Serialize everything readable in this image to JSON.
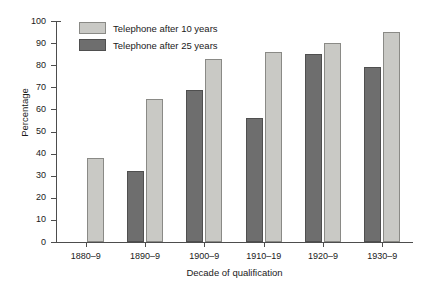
{
  "chart_data": {
    "type": "bar",
    "title": "",
    "xlabel": "Decade of qualification",
    "ylabel": "Percentage",
    "categories": [
      "1880–9",
      "1890–9",
      "1900–9",
      "1910–19",
      "1920–9",
      "1930–9"
    ],
    "series": [
      {
        "name": "Telephone after 25 years",
        "color": "#6e6e6e",
        "values": [
          null,
          32,
          69,
          56,
          85,
          79
        ]
      },
      {
        "name": "Telephone after 10 years",
        "color": "#c9c9c5",
        "values": [
          38,
          64.5,
          83,
          86,
          90,
          95
        ]
      }
    ],
    "ylim": [
      0,
      100
    ],
    "yticks": [
      0,
      10,
      20,
      30,
      40,
      50,
      60,
      70,
      80,
      90,
      100
    ],
    "ytick_labels": [
      "0",
      "10",
      "20",
      "30",
      "40",
      "50",
      "60",
      "70",
      "80",
      "90",
      "100"
    ],
    "grid": false,
    "legend_position": "top-left",
    "legend": [
      "Telephone after 10 years",
      "Telephone after 25 years"
    ],
    "axis_color": "#4d4d4d",
    "background": "#ffffff"
  },
  "legend": {
    "items": [
      {
        "label": "Telephone after 10 years",
        "swatch": "light"
      },
      {
        "label": "Telephone after 25 years",
        "swatch": "dark"
      }
    ]
  },
  "axes": {
    "y_title": "Percentage",
    "x_title": "Decade of qualification"
  }
}
